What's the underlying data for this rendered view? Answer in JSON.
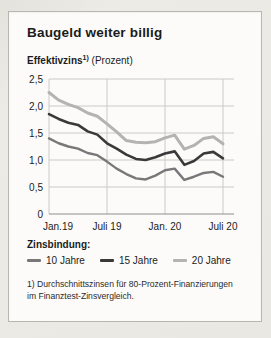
{
  "header": {
    "title": "Baugeld weiter billig",
    "subtitle_main": "Effektivzins",
    "subtitle_sup": "1)",
    "subtitle_unit": " (Prozent)"
  },
  "legend": {
    "title": "Zinsbindung:"
  },
  "footnote": {
    "line1": "1) Durchschnittszinsen für 80-Prozent-Finanzierungen",
    "line2": "im Finanztest-Zinsvergleich."
  },
  "chart_data": {
    "type": "line",
    "title": "Baugeld weiter billig",
    "ylabel": "Effektivzins (Prozent)",
    "ylim": [
      0,
      2.5
    ],
    "grid": true,
    "legend_position": "bottom",
    "categories": [
      "Jan. 19",
      "Feb. 19",
      "März 19",
      "Apr. 19",
      "Mai 19",
      "Juni 19",
      "Juli 19",
      "Aug. 19",
      "Sep. 19",
      "Okt. 19",
      "Nov. 19",
      "Dez. 19",
      "Jan. 20",
      "Feb. 20",
      "März 20",
      "Apr. 20",
      "Mai 20",
      "Juni 20",
      "Juli 20"
    ],
    "y_ticks": [
      {
        "v": 2.5,
        "label": "2,5"
      },
      {
        "v": 2.0,
        "label": "2,0"
      },
      {
        "v": 1.5,
        "label": "1,5"
      },
      {
        "v": 1.0,
        "label": "1,0"
      },
      {
        "v": 0.5,
        "label": "0,5"
      },
      {
        "v": 0,
        "label": "0"
      }
    ],
    "x_ticks": [
      {
        "i": 0,
        "label": "Jan.19"
      },
      {
        "i": 6,
        "label": "Juli 19"
      },
      {
        "i": 12,
        "label": "Jan. 20"
      },
      {
        "i": 18,
        "label": "Juli 20"
      }
    ],
    "series": [
      {
        "name": "10 Jahre",
        "color": "#78787a",
        "width": 2.4,
        "values": [
          1.4,
          1.31,
          1.25,
          1.21,
          1.13,
          1.09,
          0.97,
          0.84,
          0.74,
          0.66,
          0.64,
          0.71,
          0.81,
          0.84,
          0.63,
          0.69,
          0.76,
          0.78,
          0.69
        ]
      },
      {
        "name": "15 Jahre",
        "color": "#3a393a",
        "width": 2.6,
        "values": [
          1.85,
          1.76,
          1.69,
          1.65,
          1.53,
          1.47,
          1.31,
          1.21,
          1.1,
          1.02,
          1.0,
          1.05,
          1.12,
          1.16,
          0.91,
          0.98,
          1.12,
          1.15,
          1.03
        ]
      },
      {
        "name": "20 Jahre",
        "color": "#b4b3b1",
        "width": 3,
        "values": [
          2.25,
          2.11,
          2.03,
          1.97,
          1.87,
          1.81,
          1.67,
          1.52,
          1.36,
          1.33,
          1.32,
          1.34,
          1.41,
          1.46,
          1.2,
          1.27,
          1.4,
          1.43,
          1.3
        ]
      }
    ],
    "colors": {
      "grid": "#cbcac6",
      "axis": "#8f8e8b",
      "text": "#1b1b1b"
    }
  }
}
